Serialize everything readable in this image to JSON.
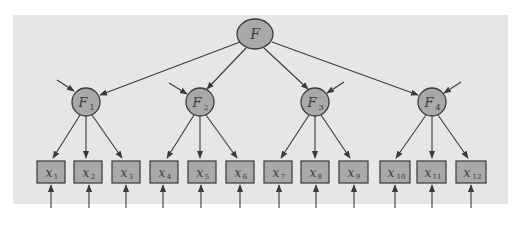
{
  "diagram": {
    "type": "hierarchical factor model (second-order confirmatory factor analysis path diagram)",
    "colors": {
      "panel_bg": "#e6e6e6",
      "node_fill": "#a9a9a9",
      "node_stroke": "#3a3a3a",
      "edge": "#3a3a3a",
      "text": "#3a3a3a"
    },
    "top_factor": {
      "label": "F",
      "subscript": ""
    },
    "factors": [
      {
        "label": "F",
        "subscript": "1",
        "indicators": [
          {
            "label": "x",
            "subscript": "1"
          },
          {
            "label": "x",
            "subscript": "2"
          },
          {
            "label": "x",
            "subscript": "3"
          }
        ]
      },
      {
        "label": "F",
        "subscript": "2",
        "indicators": [
          {
            "label": "x",
            "subscript": "4"
          },
          {
            "label": "x",
            "subscript": "5"
          },
          {
            "label": "x",
            "subscript": "6"
          }
        ]
      },
      {
        "label": "F",
        "subscript": "3",
        "indicators": [
          {
            "label": "x",
            "subscript": "7"
          },
          {
            "label": "x",
            "subscript": "8"
          },
          {
            "label": "x",
            "subscript": "9"
          }
        ]
      },
      {
        "label": "F",
        "subscript": "4",
        "indicators": [
          {
            "label": "x",
            "subscript": "10"
          },
          {
            "label": "x",
            "subscript": "11"
          },
          {
            "label": "x",
            "subscript": "12"
          }
        ]
      }
    ]
  }
}
